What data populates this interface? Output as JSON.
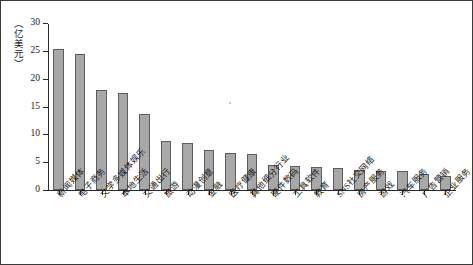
{
  "chart_data": {
    "type": "bar",
    "title": "",
    "xlabel": "",
    "ylabel": "（亿美元）",
    "ylim": [
      0,
      30
    ],
    "yticks": [
      0,
      5,
      10,
      15,
      20,
      25,
      30
    ],
    "grid": false,
    "legend": null,
    "categories": [
      "新闻媒体",
      "电子商务",
      "文学多媒体娱乐",
      "本地生活",
      "交通出行",
      "旅游",
      "动漫创意",
      "金融",
      "医疗健康",
      "其他细分行业",
      "硬件数码",
      "工具软件",
      "教育",
      "SNS社交网络",
      "房产服务",
      "游戏",
      "汽车服务",
      "广告营销",
      "企业服务"
    ],
    "values": [
      25.4,
      24.4,
      18.0,
      17.4,
      13.7,
      8.8,
      8.4,
      7.2,
      6.6,
      6.5,
      4.5,
      4.3,
      4.1,
      4.0,
      3.6,
      3.4,
      3.4,
      2.8,
      2.5
    ],
    "colors": {
      "bar_fill": "#a8a8a8",
      "bar_edge": "#5d5d5d",
      "axis": "#2b2b2b",
      "text": "#1a1a1a",
      "background": "#ffffff",
      "frame": "#3a3a3a"
    }
  }
}
